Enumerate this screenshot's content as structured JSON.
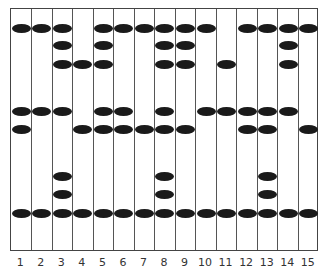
{
  "diagram": {
    "type": "bead-grid",
    "columns": 15,
    "column_labels": [
      "1",
      "2",
      "3",
      "4",
      "5",
      "6",
      "7",
      "8",
      "9",
      "10",
      "11",
      "12",
      "13",
      "14",
      "15"
    ],
    "row_y": [
      27,
      44,
      63,
      110,
      128,
      175,
      193,
      212
    ],
    "beads_by_column": [
      [
        1,
        4,
        5,
        8
      ],
      [
        1,
        4,
        8
      ],
      [
        1,
        2,
        3,
        4,
        6,
        7,
        8
      ],
      [
        3,
        5,
        8
      ],
      [
        1,
        2,
        3,
        4,
        5,
        8
      ],
      [
        1,
        4,
        5,
        8
      ],
      [
        1,
        5,
        8
      ],
      [
        1,
        2,
        3,
        4,
        5,
        6,
        7,
        8
      ],
      [
        1,
        2,
        3,
        5,
        8
      ],
      [
        1,
        4,
        8
      ],
      [
        3,
        4,
        8
      ],
      [
        1,
        4,
        5,
        8
      ],
      [
        1,
        4,
        5,
        6,
        7,
        8
      ],
      [
        1,
        2,
        3,
        4,
        8
      ],
      [
        1,
        5,
        8
      ]
    ],
    "colors": {
      "bead": "#1a1a1a",
      "line": "#555555",
      "background": "#ffffff"
    }
  }
}
